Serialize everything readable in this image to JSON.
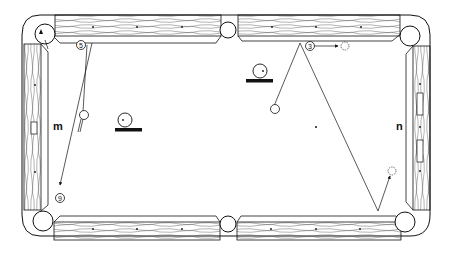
{
  "diagram": {
    "labels": {
      "m": "m",
      "n": "n"
    },
    "balls": [
      {
        "id": "ball-5",
        "number": "5"
      },
      {
        "id": "ball-3",
        "number": "3"
      },
      {
        "id": "ball-9",
        "number": "9"
      },
      {
        "id": "ball-1",
        "number": "1"
      }
    ],
    "colors": {
      "ink": "#111111",
      "background": "#ffffff",
      "wood_grain": "#555555"
    }
  }
}
